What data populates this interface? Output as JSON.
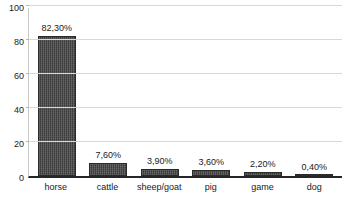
{
  "chart_data": {
    "type": "bar",
    "title": "",
    "xlabel": "",
    "ylabel": "",
    "categories": [
      "horse",
      "cattle",
      "sheep/goat",
      "pig",
      "game",
      "dog"
    ],
    "values": [
      82.3,
      7.6,
      3.9,
      3.6,
      2.2,
      0.4
    ],
    "data_labels": [
      "82,30%",
      "7,60%",
      "3,90%",
      "3,60%",
      "2,20%",
      "0,40%"
    ],
    "ylim": [
      0,
      100
    ],
    "y_ticks": [
      0,
      20,
      40,
      60,
      80,
      100
    ],
    "y_tick_labels": [
      "0",
      "20",
      "40",
      "60",
      "80",
      "100"
    ],
    "grid": true,
    "legend": false,
    "legend_position": "none",
    "bar_color": "#3a3a3a",
    "gridline_color": "#d8d8d8",
    "axis_color": "#262626",
    "background_color": "#ffffff"
  }
}
